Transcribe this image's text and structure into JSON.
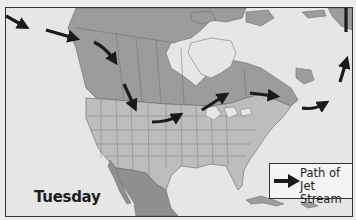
{
  "map": {
    "title": "Path of Jet Stream over North America",
    "day_label": "Tuesday",
    "region": "North America",
    "colors": {
      "ocean": "#e6e6e6",
      "canada": "#9c9c9c",
      "usa": "#bdbdbd",
      "mexico": "#8f8f8f",
      "arrow": "#1a1a1a",
      "border": "#333333"
    },
    "jet_stream_arrows": [
      {
        "id": 1,
        "location": "North Pacific (west edge)",
        "direction": "east-southeast"
      },
      {
        "id": 2,
        "location": "Gulf of Alaska",
        "direction": "east"
      },
      {
        "id": 3,
        "location": "British Columbia coast",
        "direction": "southeast"
      },
      {
        "id": 4,
        "location": "Idaho / Montana",
        "direction": "south"
      },
      {
        "id": 5,
        "location": "Nebraska / South Dakota",
        "direction": "east"
      },
      {
        "id": 6,
        "location": "Minnesota / Ontario",
        "direction": "northeast"
      },
      {
        "id": 7,
        "location": "Quebec",
        "direction": "east"
      },
      {
        "id": 8,
        "location": "off Nova Scotia",
        "direction": "east"
      },
      {
        "id": 9,
        "location": "North Atlantic",
        "direction": "north"
      }
    ]
  },
  "legend": {
    "line1": "Path of",
    "line2": "Jet Stream",
    "symbol": "arrow-right"
  }
}
